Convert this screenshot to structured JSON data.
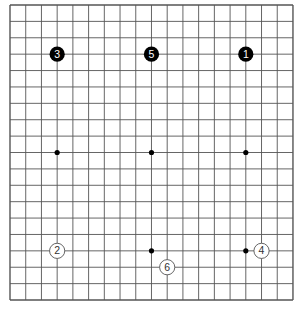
{
  "board": {
    "size": 19,
    "background": "#ffffff",
    "line_color": "#555555",
    "origin": {
      "x": 10,
      "y": 5
    },
    "spacing": {
      "x": 15.72,
      "y": 16.39
    },
    "star_points": [
      [
        3,
        3
      ],
      [
        9,
        3
      ],
      [
        15,
        3
      ],
      [
        3,
        9
      ],
      [
        9,
        9
      ],
      [
        15,
        9
      ],
      [
        3,
        15
      ],
      [
        9,
        15
      ],
      [
        15,
        15
      ]
    ],
    "hidden_star_points": [
      [
        3,
        3
      ],
      [
        9,
        3
      ],
      [
        15,
        3
      ],
      [
        3,
        15
      ]
    ]
  },
  "stones": [
    {
      "move": "1",
      "color": "black",
      "col": 15,
      "row": 3
    },
    {
      "move": "2",
      "color": "white",
      "col": 3,
      "row": 15
    },
    {
      "move": "3",
      "color": "black",
      "col": 3,
      "row": 3
    },
    {
      "move": "4",
      "color": "white",
      "col": 16,
      "row": 15
    },
    {
      "move": "5",
      "color": "black",
      "col": 9,
      "row": 3
    },
    {
      "move": "6",
      "color": "white",
      "col": 10,
      "row": 16
    }
  ]
}
